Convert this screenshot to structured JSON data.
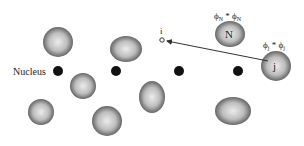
{
  "diagram": {
    "nucleus_label": "Nucleus",
    "point_label": "i",
    "blob_N_label": "N",
    "blob_j_label": "j",
    "phi_N_label": "ϕN * ϕN",
    "phi_N": {
      "base": "ϕ",
      "sub": "N",
      "op": " * "
    },
    "phi_j": {
      "base": "ϕ",
      "sub": "j",
      "op": " * "
    },
    "colors": {
      "blob_edge": "#4a4a4a",
      "blob_center": "#e8e8e8",
      "nucleus": "#111111",
      "arrow": "#333333"
    }
  }
}
